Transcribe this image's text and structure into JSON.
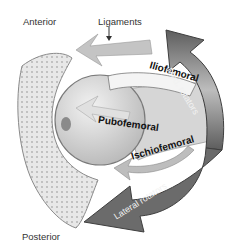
{
  "diagram": {
    "orientation_labels": {
      "anterior": "Anterior",
      "posterior": "Posterior"
    },
    "callout": {
      "label": "Ligaments",
      "arrow": "down-arrow"
    },
    "ligaments": [
      {
        "name": "Iliofemoral"
      },
      {
        "name": "Pubofemoral"
      },
      {
        "name": "Ischiofemoral"
      }
    ],
    "rotator_arrows": [
      {
        "name": "Med. rotators",
        "direction": "counterclockwise-up",
        "color": "#6a6a6a"
      },
      {
        "name": "Lateral rotators",
        "direction": "clockwise-down",
        "color": "#6a6a6a"
      }
    ],
    "colors": {
      "background": "#ffffff",
      "bone": "#e4e4e4",
      "femoral_head": "#d9d9d9",
      "arrow_dark": "#666666",
      "arrow_light": "#c8c8c8",
      "text": "#333333"
    }
  }
}
